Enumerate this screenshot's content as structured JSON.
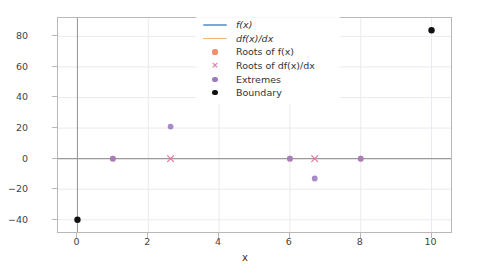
{
  "chart_data": {
    "type": "line",
    "title": "",
    "xlabel": "x",
    "ylabel": "",
    "xlim": [
      -0.55,
      10.55
    ],
    "ylim": [
      -48,
      92
    ],
    "xticks": [
      0,
      2,
      4,
      6,
      8,
      10
    ],
    "yticks": [
      -40,
      -20,
      0,
      20,
      40,
      60,
      80
    ],
    "grid": true,
    "legend_position": "upper center",
    "series": [
      {
        "name": "f(x)",
        "kind": "line",
        "color": "#7fa8d1",
        "expression": "0.833*(x-1)*(x-6)*(x-8)",
        "x": [
          0,
          0.5,
          1,
          1.5,
          2,
          2.5,
          2.63,
          3,
          3.5,
          4,
          4.5,
          5,
          5.5,
          6,
          6.5,
          6.7,
          7,
          7.5,
          8,
          8.5,
          9,
          9.5,
          10
        ],
        "y": [
          -40,
          -27.1,
          0,
          13.6,
          20,
          21,
          21.0,
          20.8,
          17.7,
          13.3,
          8.2,
          2.9,
          -2.2,
          -6.7,
          -10.3,
          -12.9,
          -12.5,
          -10.4,
          0,
          12.3,
          30,
          53.6,
          83.3
        ]
      },
      {
        "name": "df(x)/dx",
        "kind": "line",
        "color": "#efb77c",
        "expression": "0.833*(3x^2 - 30x + 62)",
        "x": [
          0,
          1,
          2,
          2.63,
          3,
          4,
          5,
          6,
          6.7,
          7,
          8,
          9,
          10
        ],
        "y": [
          51.6,
          29.1,
          11.6,
          0,
          -0.8,
          -8.3,
          -10.8,
          -8.3,
          0,
          -0.8,
          11.6,
          29.1,
          51.6
        ]
      }
    ],
    "markers": [
      {
        "name": "Roots of f(x)",
        "style": "dot",
        "color": "#f28e6b",
        "points": [
          [
            1,
            0
          ],
          [
            6,
            0
          ],
          [
            8,
            0
          ]
        ]
      },
      {
        "name": "Roots of df(x)/dx",
        "style": "x",
        "color": "#e87ca8",
        "points": [
          [
            2.63,
            0
          ],
          [
            6.7,
            0
          ]
        ]
      },
      {
        "name": "Extremes",
        "style": "dot",
        "color": "#9b7ac0",
        "points": [
          [
            2.63,
            21
          ],
          [
            6.7,
            -13
          ],
          [
            1,
            0
          ],
          [
            6,
            0
          ],
          [
            8,
            0
          ]
        ]
      },
      {
        "name": "Boundary",
        "style": "dot",
        "color": "#111111",
        "points": [
          [
            0,
            -40
          ],
          [
            10,
            84
          ]
        ]
      }
    ]
  },
  "legend": {
    "items": [
      {
        "label": "f(x)",
        "key": "line",
        "color": "#7fa8d1",
        "italic": true
      },
      {
        "label": "df(x)/dx",
        "key": "line",
        "color": "#efb77c",
        "italic": true
      },
      {
        "label": "Roots of f(x)",
        "key": "dot",
        "color": "#f28e6b",
        "italic": false
      },
      {
        "label": "Roots of df(x)/dx",
        "key": "x",
        "color": "#e87ca8",
        "italic": false
      },
      {
        "label": "Extremes",
        "key": "dot",
        "color": "#9b7ac0",
        "italic": false
      },
      {
        "label": "Boundary",
        "key": "dot",
        "color": "#111111",
        "italic": false
      }
    ]
  },
  "axis": {
    "xtick_labels": [
      "0",
      "2",
      "4",
      "6",
      "8",
      "10"
    ],
    "ytick_labels": [
      "80",
      "60",
      "40",
      "20",
      "0",
      "−20",
      "−40"
    ],
    "xlabel": "x"
  },
  "colors": {
    "fx_line": "#7fa8d1",
    "dfx_line": "#efb77c",
    "roots_fx": "#f28e6b",
    "roots_dfx": "#e87ca8",
    "extremes": "#9b7ac0",
    "boundary": "#111111",
    "grid": "#eaeaf0",
    "spine": "#b8b8b8",
    "zero_line": "#9a9a9a"
  }
}
